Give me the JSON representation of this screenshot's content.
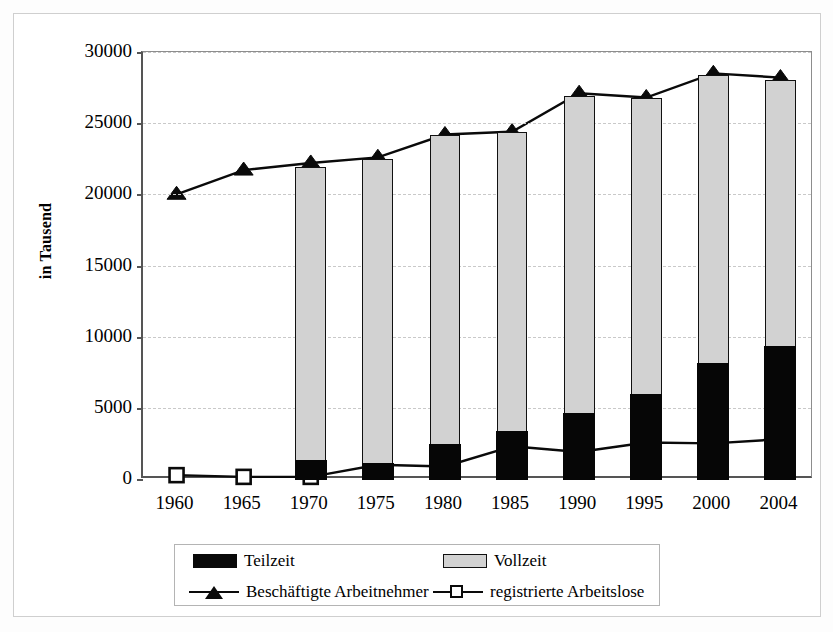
{
  "chart_data": {
    "type": "bar",
    "title": "",
    "subtitle": "",
    "xlabel": "",
    "ylabel": "in Tausend",
    "categories": [
      "1960",
      "1965",
      "1970",
      "1975",
      "1980",
      "1985",
      "1990",
      "1995",
      "2000",
      "2004"
    ],
    "ylim": [
      0,
      30000
    ],
    "ytick_labels": [
      "0",
      "5000",
      "10000",
      "15000",
      "20000",
      "25000",
      "30000"
    ],
    "ytick_values": [
      0,
      5000,
      10000,
      15000,
      20000,
      25000,
      30000
    ],
    "grid": true,
    "grid_axis": "y",
    "stacked": true,
    "legend_position": "bottom",
    "series": [
      {
        "name": "Teilzeit",
        "kind": "bar",
        "color": "#090909",
        "values": [
          null,
          null,
          1400,
          1200,
          2500,
          3400,
          4700,
          6000,
          8200,
          9400
        ]
      },
      {
        "name": "Vollzeit",
        "kind": "bar",
        "color": "#d2d2d2",
        "values": [
          null,
          null,
          20500,
          21300,
          21700,
          21000,
          22200,
          20800,
          20200,
          18600
        ]
      },
      {
        "name": "Beschäftigte Arbeitnehmer",
        "kind": "line",
        "marker": "triangle",
        "color": "#0a0a0a",
        "values": [
          20000,
          21700,
          22200,
          22600,
          24200,
          24400,
          27100,
          26800,
          28500,
          28200
        ]
      },
      {
        "name": "registrierte Arbeitslose",
        "kind": "line",
        "marker": "square",
        "color": "#0a0a0a",
        "values": [
          270,
          150,
          150,
          1000,
          880,
          2300,
          1900,
          2560,
          2500,
          2800
        ]
      }
    ]
  },
  "axis": {
    "y_title": "in Tausend"
  },
  "legend": {
    "items": [
      {
        "label": "Teilzeit",
        "swatch": "black-fill-swatch"
      },
      {
        "label": "Vollzeit",
        "swatch": "gray-fill-swatch"
      },
      {
        "label": "Beschäftigte Arbeitnehmer",
        "swatch": "triangle-line-marker"
      },
      {
        "label": "registrierte Arbeitslose",
        "swatch": "square-line-marker"
      }
    ]
  }
}
